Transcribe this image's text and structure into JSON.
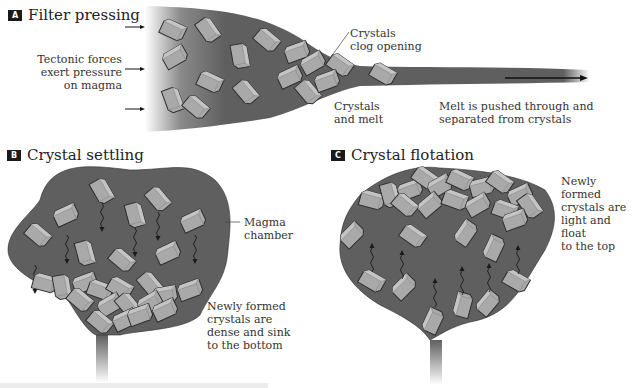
{
  "panels": {
    "a": {
      "badge": "A",
      "title": "Filter pressing",
      "labels": {
        "tectonic": [
          "Tectonic forces",
          "exert pressure",
          "on magma"
        ],
        "clog": [
          "Crystals",
          "clog opening"
        ],
        "crystals_melt": [
          "Crystals",
          "and melt"
        ],
        "melt_pushed": [
          "Melt is pushed through and",
          "separated from crystals"
        ]
      }
    },
    "b": {
      "badge": "B",
      "title": "Crystal settling",
      "labels": {
        "chamber": [
          "Magma",
          "chamber"
        ],
        "sink": [
          "Newly formed",
          "crystals are",
          "dense and sink",
          "to the bottom"
        ]
      }
    },
    "c": {
      "badge": "C",
      "title": "Crystal flotation",
      "labels": {
        "float": [
          "Newly formed",
          "crystals are",
          "light and float",
          "to the top"
        ]
      }
    }
  },
  "colors": {
    "magma": "#5f5f5f",
    "crystal": "#a9a9a9",
    "crystal_edge": "#2e2e2e",
    "badge_bg": "#1a1a1a"
  }
}
